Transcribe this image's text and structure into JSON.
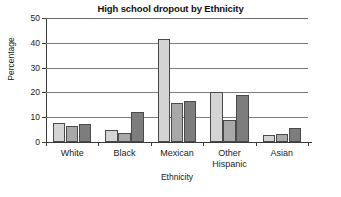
{
  "chart_data": {
    "type": "bar",
    "title": "High school dropout by Ethnicity",
    "xlabel": "Ethnicity",
    "ylabel": "Percentage",
    "categories": [
      "White",
      "Black",
      "Mexican",
      "Other Hispanic",
      "Asian"
    ],
    "series": [
      {
        "name": "series-1",
        "color": "#d4d4d4",
        "values": [
          7.7,
          5.0,
          41.5,
          20.0,
          3.0
        ]
      },
      {
        "name": "series-2",
        "color": "#a8a8a8",
        "values": [
          6.5,
          3.5,
          15.8,
          9.0,
          3.2
        ]
      },
      {
        "name": "series-3",
        "color": "#7d7d7d",
        "values": [
          7.2,
          12.3,
          16.7,
          18.9,
          5.7
        ]
      }
    ],
    "ylim": [
      0,
      50
    ],
    "yticks": [
      0,
      10,
      20,
      30,
      40,
      50
    ],
    "ytick_labels": [
      "0",
      "10",
      "20",
      "30",
      "40",
      "50"
    ],
    "grid": true,
    "legend": "none"
  }
}
